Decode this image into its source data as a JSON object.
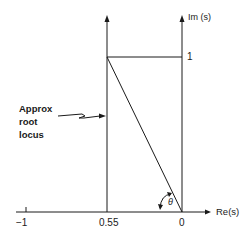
{
  "diagram": {
    "type": "root-locus-sketch",
    "axes": {
      "real_axis_label": "Re(s)",
      "imag_axis_label": "Im (s)"
    },
    "ticks": {
      "real": [
        "−1",
        "0.55",
        "0"
      ],
      "imag": [
        "1"
      ]
    },
    "annotation": {
      "text_line1": "Approx",
      "text_line2": "root",
      "text_line3": "locus"
    },
    "angle_label": "θ",
    "colors": {
      "line": "#1a1a1a",
      "background": "#ffffff"
    }
  }
}
